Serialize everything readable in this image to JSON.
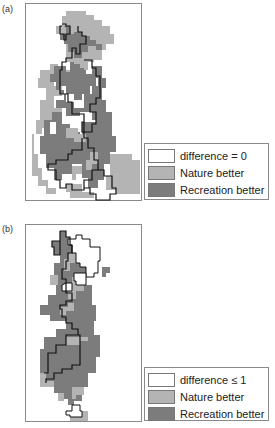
{
  "colors": {
    "difference": "#ffffff",
    "nature_better": "#b4b4b4",
    "recreation_better": "#7c7c7c",
    "boundary": "#111111"
  },
  "panels": [
    {
      "label": "(a)",
      "legend": [
        {
          "key": "difference",
          "label": "difference = 0"
        },
        {
          "key": "nature_better",
          "label": "Nature better"
        },
        {
          "key": "recreation_better",
          "label": "Recreation better"
        }
      ]
    },
    {
      "label": "(b)",
      "legend": [
        {
          "key": "difference",
          "label": "difference ≤ 1"
        },
        {
          "key": "nature_better",
          "label": "Nature better"
        },
        {
          "key": "recreation_better",
          "label": "Recreation better"
        }
      ]
    }
  ]
}
